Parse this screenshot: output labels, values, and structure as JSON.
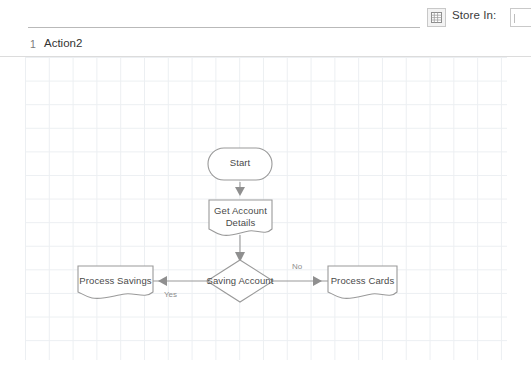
{
  "toolbar": {
    "grid_button_icon": "grid-table-icon",
    "store_in_label": "Store In:",
    "combo_icon": "dropdown-caret-icon"
  },
  "tab_row": {
    "line_number": "1",
    "tab_label": "Action2"
  },
  "canvas": {
    "grid_color": "#eceff2",
    "background": "#ffffff",
    "shape_stroke": "#9a9a9a",
    "connector_color": "#9a9a9a",
    "text_color": "#4a4a4a",
    "edge_label_color": "#8d8d8d"
  },
  "flowchart": {
    "nodes": [
      {
        "id": "start",
        "label": "Start",
        "shape": "terminator"
      },
      {
        "id": "get_account_details",
        "label": "Get Account\nDetails",
        "shape": "document"
      },
      {
        "id": "saving_account",
        "label": "Saving Account",
        "shape": "decision"
      },
      {
        "id": "process_savings",
        "label": "Process Savings",
        "shape": "document"
      },
      {
        "id": "process_cards",
        "label": "Process Cards",
        "shape": "document"
      }
    ],
    "edges": [
      {
        "from": "start",
        "to": "get_account_details",
        "label": ""
      },
      {
        "from": "get_account_details",
        "to": "saving_account",
        "label": ""
      },
      {
        "from": "saving_account",
        "to": "process_savings",
        "label": "Yes"
      },
      {
        "from": "saving_account",
        "to": "process_cards",
        "label": "No"
      }
    ]
  }
}
